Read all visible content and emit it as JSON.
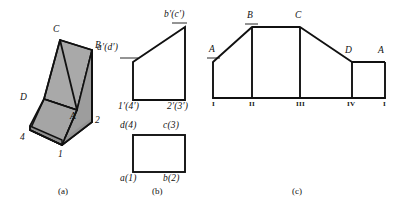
{
  "figure": {
    "background_color": "#ffffff",
    "line_color": "#111111",
    "shade_color": "#a8a8a8",
    "shade_color_dark": "#8f8f8f"
  },
  "captions": {
    "a": "(a)",
    "b": "(b)",
    "c": "(c)"
  },
  "part_a": {
    "name": "isometric-pictorial-view",
    "labels": {
      "C": "C",
      "B": "B",
      "D": "D",
      "A": "A",
      "four": "4",
      "one": "1",
      "two": "2"
    }
  },
  "part_b": {
    "name": "orthographic-projections",
    "front_view": {
      "labels": {
        "a_prime": "a′(d′)",
        "b_prime": "b′(c′)",
        "one_prime": "1′(4′)",
        "two_prime": "2′(3′)"
      }
    },
    "top_view": {
      "labels": {
        "d": "d(4)",
        "c": "c(3)",
        "a": "a(1)",
        "b": "b(2)"
      }
    }
  },
  "part_c": {
    "name": "surface-development",
    "vertex_labels": {
      "A_left": "A",
      "B": "B",
      "C": "C",
      "D": "D",
      "A_right": "A"
    },
    "panel_labels": [
      "I",
      "II",
      "III",
      "IV",
      "I"
    ]
  }
}
